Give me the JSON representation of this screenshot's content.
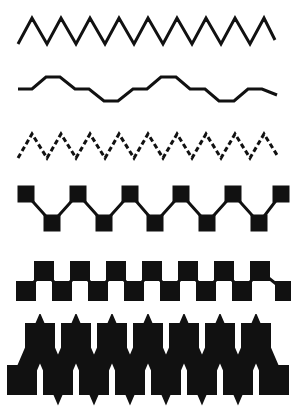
{
  "figure": {
    "background_color": "#ffffff",
    "ink_color": "#111111",
    "width": 291,
    "height": 409,
    "row_count": 6
  },
  "chart_data": {
    "type": "line",
    "subtitle": "Six horizontal zigzag waveform samples rendered in progressively heavier line styles",
    "xlabel": "",
    "ylabel": "",
    "grid": false,
    "legend": null,
    "xlim": [
      0,
      291
    ],
    "ylim": [
      0,
      409
    ],
    "series": [
      {
        "name": "row-1-thin-triangle-wave",
        "style": "solid",
        "stroke_width": 3,
        "marker": "none",
        "amplitude": 26,
        "period": 29,
        "cycles": 9,
        "baseline_y": 44,
        "peak_y": 18,
        "x_start": 18,
        "x_end": 275,
        "description": "Thin solid sharp triangle wave, tall amplitude, no markers",
        "x": [
          18,
          32,
          47,
          61,
          76,
          90,
          105,
          119,
          134,
          148,
          163,
          177,
          192,
          206,
          221,
          235,
          250,
          264,
          275
        ],
        "y": [
          44,
          18,
          44,
          18,
          44,
          18,
          44,
          18,
          44,
          18,
          44,
          18,
          44,
          18,
          44,
          18,
          44,
          18,
          40
        ]
      },
      {
        "name": "row-2-low-amplitude-stepped-wave",
        "style": "solid",
        "stroke_width": 3,
        "marker": "none",
        "amplitude": 12,
        "period": 58,
        "cycles": 4,
        "baseline_y": 89,
        "peak_y": 77,
        "x_start": 18,
        "x_end": 277,
        "description": "Thin solid low amplitude wave with flat horizontal plateaus between slopes",
        "x": [
          18,
          32,
          46,
          60,
          75,
          89,
          104,
          118,
          133,
          147,
          161,
          176,
          190,
          205,
          219,
          234,
          248,
          262,
          277
        ],
        "y": [
          89,
          89,
          77,
          77,
          89,
          89,
          101,
          101,
          89,
          89,
          77,
          77,
          89,
          89,
          101,
          101,
          89,
          89,
          95
        ]
      },
      {
        "name": "row-3-dashed-triangle-wave",
        "style": "dashed",
        "stroke_width": 3,
        "dash_pattern": [
          5,
          3
        ],
        "marker": "none",
        "amplitude": 24,
        "period": 29,
        "cycles": 9,
        "baseline_y": 158,
        "peak_y": 134,
        "x_start": 18,
        "x_end": 277,
        "description": "Dashed sharp triangle wave, medium amplitude, no markers",
        "x": [
          18,
          32,
          47,
          61,
          76,
          90,
          105,
          119,
          134,
          148,
          163,
          177,
          192,
          206,
          221,
          235,
          250,
          264,
          277
        ],
        "y": [
          158,
          134,
          158,
          134,
          158,
          134,
          158,
          134,
          158,
          134,
          158,
          134,
          158,
          134,
          158,
          134,
          158,
          134,
          155
        ]
      },
      {
        "name": "row-4-square-marker-wave",
        "style": "solid",
        "stroke_width": 3,
        "marker": "square",
        "marker_size": 17,
        "amplitude": 37,
        "period": 51,
        "cycles": 5,
        "baseline_y": 223,
        "peak_y": 194,
        "x_start": 26,
        "x_end": 281,
        "description": "Thin solid wave with large filled square markers at every peak and valley",
        "x": [
          26,
          52,
          78,
          104,
          130,
          155,
          181,
          207,
          233,
          259,
          281
        ],
        "y": [
          194,
          223,
          194,
          223,
          194,
          223,
          194,
          223,
          194,
          223,
          194
        ]
      },
      {
        "name": "row-5-dense-square-checker-wave",
        "style": "solid",
        "stroke_width": 3,
        "marker": "square",
        "marker_size": 20,
        "amplitude": 20,
        "period": 36,
        "cycles": 7,
        "baseline_y": 291,
        "peak_y": 271,
        "x_start": 26,
        "x_end": 285,
        "description": "Wave with square markers so dense they touch corner to corner forming a checkerboard band; final marker clipped at right edge",
        "x": [
          26,
          44,
          62,
          80,
          98,
          116,
          134,
          152,
          170,
          188,
          206,
          224,
          242,
          260,
          285
        ],
        "y": [
          291,
          271,
          291,
          271,
          291,
          271,
          291,
          271,
          291,
          271,
          291,
          271,
          291,
          271,
          291
        ]
      },
      {
        "name": "row-6-heavy-square-band-wave",
        "style": "solid",
        "stroke_width": 20,
        "marker": "square",
        "marker_size": 30,
        "amplitude": 28,
        "period": 36,
        "cycles": 7,
        "baseline_y": 380,
        "peak_y": 338,
        "x_start": 22,
        "x_end": 285,
        "description": "Very heavy stroke wave with oversized square markers; the merged ink leaves white octagonal holes along the band",
        "x": [
          22,
          40,
          58,
          76,
          94,
          112,
          130,
          148,
          166,
          184,
          202,
          220,
          238,
          256,
          274
        ],
        "y": [
          380,
          338,
          380,
          338,
          380,
          338,
          380,
          338,
          380,
          338,
          380,
          338,
          380,
          338,
          380
        ]
      }
    ]
  }
}
